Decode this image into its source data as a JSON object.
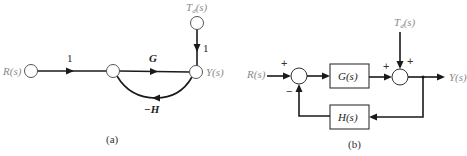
{
  "diagram_a": {
    "caption": "(a)",
    "type": "signal-flow-graph",
    "nodes": {
      "input": "R(s)",
      "disturbance": "T",
      "disturbance_sub": "d",
      "disturbance_suffix": "(s)",
      "output": "Y(s)"
    },
    "branches": {
      "input_gain": "1",
      "forward_gain": "G",
      "disturbance_gain": "1",
      "feedback_gain": "−H"
    }
  },
  "diagram_b": {
    "caption": "(b)",
    "type": "block-diagram",
    "signals": {
      "input": "R(s)",
      "disturbance": "T",
      "disturbance_sub": "d",
      "disturbance_suffix": "(s)",
      "output": "Y(s)"
    },
    "blocks": {
      "forward": "G(s)",
      "feedback": "H(s)"
    },
    "signs": {
      "sum1_input": "+",
      "sum1_feedback": "−",
      "sum2_forward": "+",
      "sum2_disturbance": "+"
    }
  },
  "colors": {
    "line": "#1a1a1a",
    "label_gray": "#8a8a8a",
    "background": "#ffffff"
  }
}
